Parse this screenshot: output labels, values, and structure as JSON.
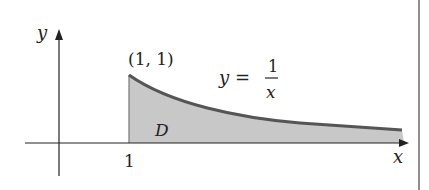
{
  "diagram": {
    "axes": {
      "x_label": "x",
      "y_label": "y",
      "x_tick_label": "1"
    },
    "point_label": "(1, 1)",
    "equation": {
      "lhs": "y =",
      "numerator": "1",
      "denominator": "x"
    },
    "region_label": "D",
    "colors": {
      "curve": "#555555",
      "region_fill": "#c8c8c8",
      "axis": "#222222"
    }
  }
}
